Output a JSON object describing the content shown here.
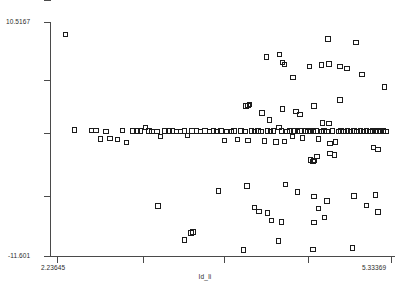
{
  "chart_data": {
    "type": "scatter",
    "title": "",
    "xlabel": "Id_li",
    "ylabel": "",
    "xlim": [
      2.23645,
      5.33369
    ],
    "ylim": [
      -11.601,
      10.5167
    ],
    "grid": false,
    "legend": null,
    "marker": "open-square",
    "marker_color": "#1c1c1c",
    "x_ticks": [
      2.23645,
      3.0,
      3.7,
      4.45,
      5.33369
    ],
    "x_tick_labels": [
      "2.23645",
      "",
      "",
      "",
      "5.33369"
    ],
    "y_ticks": [
      10.5167,
      5.0,
      0.1,
      -5.5,
      -11.601
    ],
    "y_tick_labels": [
      "10.5167",
      "",
      "",
      "",
      "-11.601"
    ],
    "series": [
      {
        "name": "data",
        "points": [
          [
            2.318,
            9.3
          ],
          [
            2.398,
            0.3
          ],
          [
            2.56,
            0.28
          ],
          [
            2.6,
            0.26
          ],
          [
            2.64,
            -0.55
          ],
          [
            2.69,
            0.18
          ],
          [
            2.73,
            -0.52
          ],
          [
            2.8,
            -0.58
          ],
          [
            2.845,
            0.25
          ],
          [
            2.88,
            -0.9
          ],
          [
            2.94,
            0.22
          ],
          [
            2.985,
            0.2
          ],
          [
            3.01,
            0.2
          ],
          [
            3.06,
            0.52
          ],
          [
            3.09,
            0.2
          ],
          [
            3.12,
            0.18
          ],
          [
            3.165,
            0.18
          ],
          [
            3.2,
            -0.3
          ],
          [
            3.24,
            0.22
          ],
          [
            3.275,
            0.2
          ],
          [
            3.31,
            0.2
          ],
          [
            3.345,
            0.18
          ],
          [
            3.38,
            0.18
          ],
          [
            3.42,
            0.2
          ],
          [
            3.45,
            -0.25
          ],
          [
            3.49,
            0.2
          ],
          [
            3.53,
            0.2
          ],
          [
            3.57,
            0.18
          ],
          [
            3.61,
            0.2
          ],
          [
            3.65,
            0.18
          ],
          [
            3.69,
            0.2
          ],
          [
            3.72,
            0.18
          ],
          [
            3.76,
            0.2
          ],
          [
            3.79,
            -0.7
          ],
          [
            3.815,
            0.18
          ],
          [
            3.85,
            0.18
          ],
          [
            3.88,
            0.2
          ],
          [
            3.91,
            -0.62
          ],
          [
            3.945,
            0.2
          ],
          [
            3.98,
            0.18
          ],
          [
            4.01,
            -0.7
          ],
          [
            4.04,
            0.2
          ],
          [
            4.07,
            0.18
          ],
          [
            4.1,
            0.2
          ],
          [
            4.13,
            0.18
          ],
          [
            4.16,
            -0.75
          ],
          [
            4.19,
            0.2
          ],
          [
            4.215,
            0.18
          ],
          [
            4.245,
            0.2
          ],
          [
            4.27,
            -0.85
          ],
          [
            4.295,
            0.55
          ],
          [
            4.32,
            0.2
          ],
          [
            4.345,
            -0.8
          ],
          [
            4.37,
            0.18
          ],
          [
            4.395,
            0.2
          ],
          [
            4.42,
            -0.3
          ],
          [
            4.44,
            0.2
          ],
          [
            4.465,
            0.18
          ],
          [
            4.49,
            0.2
          ],
          [
            4.515,
            -0.45
          ],
          [
            4.54,
            0.2
          ],
          [
            4.565,
            0.18
          ],
          [
            4.59,
            0.2
          ],
          [
            4.615,
            0.18
          ],
          [
            4.64,
            0.2
          ],
          [
            4.665,
            -0.55
          ],
          [
            4.69,
            0.18
          ],
          [
            4.715,
            0.2
          ],
          [
            4.74,
            0.18
          ],
          [
            4.77,
            -0.95
          ],
          [
            4.795,
            0.2
          ],
          [
            4.82,
            -0.85
          ],
          [
            4.845,
            0.18
          ],
          [
            4.87,
            0.2
          ],
          [
            4.9,
            0.18
          ],
          [
            4.93,
            0.2
          ],
          [
            4.96,
            0.18
          ],
          [
            4.99,
            0.2
          ],
          [
            5.02,
            0.18
          ],
          [
            5.05,
            0.2
          ],
          [
            5.08,
            0.18
          ],
          [
            5.11,
            0.2
          ],
          [
            5.14,
            0.18
          ],
          [
            5.165,
            0.2
          ],
          [
            5.19,
            0.18
          ],
          [
            5.215,
            0.2
          ],
          [
            5.24,
            0.18
          ],
          [
            5.265,
            0.2
          ],
          [
            5.29,
            0.18
          ],
          [
            4.86,
            3.15
          ],
          [
            4.62,
            2.55
          ],
          [
            4.455,
            2.05
          ],
          [
            4.33,
            2.3
          ],
          [
            4.01,
            2.6
          ],
          [
            4.02,
            2.72
          ],
          [
            3.99,
            2.58
          ],
          [
            4.14,
            1.9
          ],
          [
            4.49,
            1.75
          ],
          [
            4.21,
            1.25
          ],
          [
            4.7,
            0.95
          ],
          [
            4.76,
            0.9
          ],
          [
            4.425,
            5.25
          ],
          [
            4.18,
            7.2
          ],
          [
            4.3,
            7.45
          ],
          [
            4.33,
            6.65
          ],
          [
            4.345,
            6.5
          ],
          [
            4.75,
            8.9
          ],
          [
            5.01,
            8.55
          ],
          [
            4.58,
            6.3
          ],
          [
            4.69,
            6.45
          ],
          [
            4.76,
            6.55
          ],
          [
            4.86,
            6.3
          ],
          [
            4.925,
            6.1
          ],
          [
            5.065,
            5.55
          ],
          [
            5.275,
            4.35
          ],
          [
            5.17,
            -1.35
          ],
          [
            5.215,
            -1.55
          ],
          [
            4.77,
            -1.9
          ],
          [
            4.81,
            -2.05
          ],
          [
            4.59,
            -2.55
          ],
          [
            4.62,
            -2.6
          ],
          [
            4.61,
            -2.7
          ],
          [
            4.65,
            -2.2
          ],
          [
            3.735,
            -5.45
          ],
          [
            4.0,
            -5.0
          ],
          [
            4.355,
            -4.85
          ],
          [
            4.47,
            -5.55
          ],
          [
            4.62,
            -6.0
          ],
          [
            4.74,
            -6.4
          ],
          [
            4.99,
            -5.95
          ],
          [
            5.19,
            -5.85
          ],
          [
            5.105,
            -6.85
          ],
          [
            4.66,
            -7.1
          ],
          [
            4.07,
            -7.05
          ],
          [
            4.11,
            -7.4
          ],
          [
            4.19,
            -7.55
          ],
          [
            4.225,
            -8.25
          ],
          [
            4.32,
            -8.4
          ],
          [
            4.62,
            -8.45
          ],
          [
            4.72,
            -7.95
          ],
          [
            5.215,
            -7.45
          ],
          [
            3.175,
            -6.9
          ],
          [
            3.48,
            -9.45
          ],
          [
            3.5,
            -9.35
          ],
          [
            3.42,
            -10.1
          ],
          [
            4.29,
            -10.2
          ],
          [
            4.61,
            -11.0
          ],
          [
            4.98,
            -10.85
          ],
          [
            3.965,
            -11.05
          ]
        ]
      }
    ]
  }
}
